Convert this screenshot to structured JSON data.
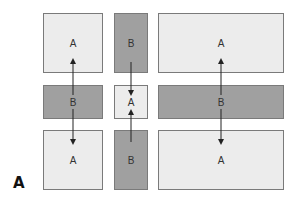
{
  "panel_label": "A",
  "colors": {
    "light_fill": "#ececec",
    "dark_fill": "#a0a0a0",
    "border": "#7a7a7a",
    "arrow": "#222222"
  },
  "columns": [
    {
      "name": "left",
      "boxes": [
        {
          "label": "A",
          "tone": "light"
        },
        {
          "label": "B",
          "tone": "dark"
        },
        {
          "label": "A",
          "tone": "light"
        }
      ],
      "arrows": [
        {
          "from": "B",
          "to": "top A",
          "direction": "up"
        },
        {
          "from": "B",
          "to": "bottom A",
          "direction": "down"
        }
      ]
    },
    {
      "name": "middle",
      "boxes": [
        {
          "label": "B",
          "tone": "dark"
        },
        {
          "label": "A",
          "tone": "light"
        },
        {
          "label": "B",
          "tone": "dark"
        }
      ],
      "arrows": [
        {
          "from": "top B",
          "to": "A",
          "direction": "down"
        },
        {
          "from": "bottom B",
          "to": "A",
          "direction": "up"
        }
      ]
    },
    {
      "name": "right",
      "boxes": [
        {
          "label": "A",
          "tone": "light"
        },
        {
          "label": "B",
          "tone": "dark"
        },
        {
          "label": "A",
          "tone": "light"
        }
      ],
      "arrows": [
        {
          "from": "B",
          "to": "top A",
          "direction": "up"
        },
        {
          "from": "B",
          "to": "bottom A",
          "direction": "down"
        }
      ]
    }
  ]
}
